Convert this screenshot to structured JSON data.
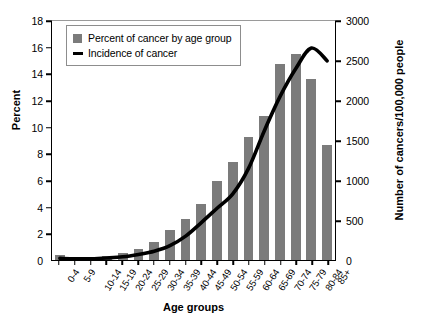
{
  "chart_data": {
    "type": "bar",
    "title": "",
    "xlabel": "Age groups",
    "ylabel": "Percent",
    "ylabel_right": "Number of cancers/100,000 people",
    "categories": [
      "0-4",
      "5-9",
      "10-14",
      "15-19",
      "20-24",
      "25-29",
      "30-34",
      "35-39",
      "40-44",
      "45-49",
      "50-54",
      "55-59",
      "60-64",
      "65-69",
      "70-74",
      "75-79",
      "80-84",
      "85+"
    ],
    "ylim": [
      0,
      18
    ],
    "yticks": [
      0,
      2,
      4,
      6,
      8,
      10,
      12,
      14,
      16,
      18
    ],
    "ylim_right": [
      0,
      3000
    ],
    "yticks_right": [
      0,
      500,
      1000,
      1500,
      2000,
      2500,
      3000
    ],
    "grid": false,
    "legend_position": "upper left",
    "series": [
      {
        "name": "Percent of cancer by age group",
        "kind": "bar",
        "axis": "left",
        "color": "#7b7b7b",
        "values": [
          0.4,
          0.25,
          0.2,
          0.3,
          0.5,
          0.8,
          1.4,
          2.3,
          3.1,
          4.2,
          6.0,
          7.4,
          9.3,
          10.9,
          14.8,
          15.6,
          13.7,
          8.7
        ]
      },
      {
        "name": "Incidence of cancer",
        "kind": "line",
        "axis": "right",
        "color": "#000000",
        "values": [
          20,
          15,
          15,
          25,
          40,
          70,
          110,
          180,
          300,
          470,
          650,
          830,
          1150,
          1620,
          2050,
          2400,
          2660,
          2500
        ]
      }
    ]
  },
  "legend": {
    "items": [
      {
        "label": "Percent of cancer by age group",
        "marker": "square-swatch"
      },
      {
        "label": "Incidence of cancer",
        "marker": "line-swatch"
      }
    ]
  }
}
